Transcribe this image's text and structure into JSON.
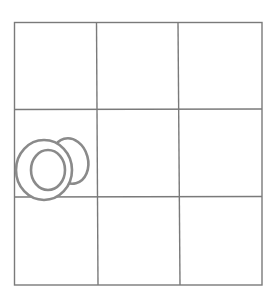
{
  "game": {
    "type": "tic-tac-toe",
    "rows": 3,
    "cols": 3,
    "line_color": "#7a7a7a",
    "mark_color": "#8a8a8a",
    "cells": [
      [
        "",
        "",
        ""
      ],
      [
        "O",
        "",
        ""
      ],
      [
        "",
        "",
        ""
      ]
    ]
  }
}
